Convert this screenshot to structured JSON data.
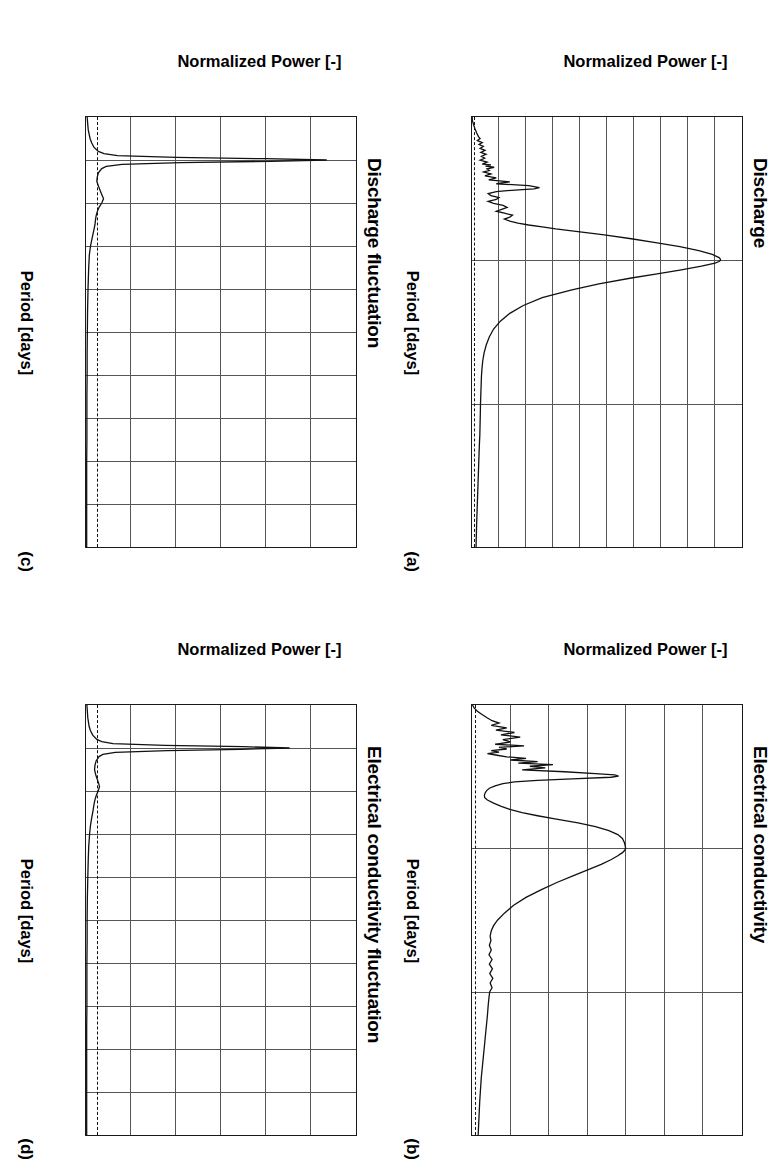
{
  "figure": {
    "axis_label_x": "Period [days]",
    "axis_label_y": "Normalized Power [-]"
  },
  "panels": [
    {
      "id": "a",
      "letter": "(a)",
      "title": "Discharge",
      "xlabel": "Period [days]",
      "ylabel": "Normalized Power [-]",
      "xticks": [
        "0",
        "365",
        "730",
        "1095"
      ],
      "yticks": [
        "0",
        "1000",
        "2000",
        "3000",
        "4000",
        "5000",
        "6000",
        "7000",
        "8000",
        "9000",
        "10000"
      ]
    },
    {
      "id": "b",
      "letter": "(b)",
      "title": "Electrical conductivity",
      "xlabel": "Period [days]",
      "ylabel": "Normalized Power [-]",
      "xticks": [
        "0",
        "365",
        "730",
        "1095"
      ],
      "yticks": [
        "0",
        "1000",
        "2000",
        "3000",
        "4000",
        "5000",
        "6000",
        "7000"
      ]
    },
    {
      "id": "c",
      "letter": "(c)",
      "title": "Discharge fluctuation",
      "xlabel": "Period [days]",
      "ylabel": "Normalized Power [-]",
      "xticks": [
        "0",
        "1",
        "2",
        "3",
        "4",
        "5",
        "6",
        "7",
        "8",
        "9",
        "10"
      ],
      "yticks": [
        "0",
        "200",
        "400",
        "600",
        "800",
        "1000",
        "1200"
      ]
    },
    {
      "id": "d",
      "letter": "(d)",
      "title": "Electrical conductivity fluctuation",
      "xlabel": "Period [days]",
      "ylabel": "Normalized Power [-]",
      "xticks": [
        "0",
        "1",
        "2",
        "3",
        "4",
        "5",
        "6",
        "7",
        "8",
        "9",
        "10"
      ],
      "yticks": [
        "0",
        "200",
        "400",
        "600",
        "800",
        "1000",
        "1200"
      ]
    }
  ],
  "chart_data": [
    {
      "type": "line",
      "panel": "a",
      "title": "Discharge",
      "xlabel": "Period [days]",
      "ylabel": "Normalized Power [-]",
      "xlim": [
        0,
        1095
      ],
      "ylim": [
        0,
        10000
      ],
      "xticks": [
        0,
        365,
        730,
        1095
      ],
      "yticks": [
        0,
        1000,
        2000,
        3000,
        4000,
        5000,
        6000,
        7000,
        8000,
        9000,
        10000
      ],
      "grid": true,
      "legend": "none",
      "annotations": [
        "(a)"
      ],
      "significance_threshold": 120,
      "x": [
        0,
        10,
        20,
        30,
        40,
        50,
        55,
        60,
        65,
        70,
        75,
        80,
        85,
        90,
        95,
        100,
        105,
        110,
        115,
        120,
        122,
        125,
        128,
        132,
        136,
        140,
        145,
        150,
        155,
        160,
        165,
        170,
        175,
        180,
        183,
        186,
        190,
        195,
        200,
        205,
        210,
        215,
        220,
        225,
        230,
        235,
        240,
        245,
        250,
        255,
        260,
        265,
        270,
        275,
        280,
        285,
        290,
        295,
        300,
        310,
        320,
        330,
        340,
        350,
        358,
        362,
        365,
        368,
        372,
        380,
        390,
        400,
        410,
        425,
        440,
        460,
        480,
        500,
        520,
        540,
        560,
        580,
        600,
        620,
        640,
        660,
        680,
        700,
        720,
        730,
        750,
        780,
        810,
        840,
        880,
        920,
        960,
        1000,
        1040,
        1095
      ],
      "y": [
        5,
        20,
        60,
        110,
        170,
        240,
        300,
        200,
        380,
        260,
        420,
        300,
        480,
        330,
        520,
        350,
        470,
        300,
        560,
        380,
        700,
        500,
        820,
        560,
        640,
        430,
        700,
        480,
        900,
        620,
        1400,
        900,
        2100,
        2500,
        2300,
        1600,
        900,
        600,
        700,
        1000,
        900,
        600,
        800,
        1150,
        1300,
        1100,
        900,
        1200,
        1500,
        1400,
        1200,
        1400,
        1700,
        2100,
        2600,
        3100,
        3700,
        4300,
        4900,
        5900,
        6800,
        7700,
        8400,
        8900,
        9150,
        9200,
        9200,
        9150,
        9000,
        8500,
        7700,
        6800,
        5900,
        4700,
        3700,
        2600,
        1900,
        1400,
        1050,
        800,
        640,
        530,
        450,
        400,
        370,
        350,
        340,
        330,
        320,
        315,
        310,
        300,
        290,
        270,
        250,
        230,
        210,
        190,
        170,
        150,
        120
      ]
    },
    {
      "type": "line",
      "panel": "b",
      "title": "Electrical conductivity",
      "xlabel": "Period [days]",
      "ylabel": "Normalized Power [-]",
      "xlim": [
        0,
        1095
      ],
      "ylim": [
        0,
        7000
      ],
      "xticks": [
        0,
        365,
        730,
        1095
      ],
      "yticks": [
        0,
        1000,
        2000,
        3000,
        4000,
        5000,
        6000,
        7000
      ],
      "grid": true,
      "legend": "none",
      "annotations": [
        "(b)"
      ],
      "significance_threshold": 110,
      "x": [
        0,
        8,
        16,
        24,
        32,
        40,
        46,
        52,
        58,
        64,
        70,
        76,
        82,
        88,
        94,
        100,
        104,
        108,
        112,
        116,
        120,
        124,
        128,
        132,
        136,
        140,
        144,
        148,
        152,
        156,
        160,
        165,
        170,
        175,
        178,
        181,
        184,
        188,
        192,
        196,
        200,
        206,
        212,
        218,
        224,
        230,
        236,
        242,
        250,
        258,
        266,
        274,
        282,
        290,
        300,
        310,
        320,
        330,
        340,
        350,
        358,
        363,
        366,
        370,
        376,
        384,
        394,
        406,
        420,
        436,
        452,
        470,
        490,
        510,
        530,
        548,
        562,
        575,
        588,
        600,
        612,
        624,
        636,
        648,
        660,
        672,
        684,
        696,
        708,
        720,
        730,
        745,
        765,
        790,
        820,
        860,
        900,
        950,
        1010,
        1095
      ],
      "y": [
        10,
        60,
        140,
        260,
        380,
        520,
        700,
        500,
        900,
        620,
        1100,
        750,
        1250,
        800,
        1000,
        600,
        1350,
        700,
        900,
        500,
        700,
        400,
        650,
        900,
        1400,
        1000,
        1700,
        1200,
        2100,
        1500,
        1900,
        1300,
        2400,
        3200,
        3700,
        3800,
        3600,
        2600,
        1700,
        1100,
        800,
        600,
        450,
        380,
        340,
        320,
        330,
        400,
        560,
        760,
        980,
        1300,
        1700,
        2150,
        2750,
        3200,
        3550,
        3780,
        3900,
        3950,
        3970,
        3980,
        3980,
        3960,
        3900,
        3780,
        3600,
        3350,
        3000,
        2600,
        2200,
        1800,
        1400,
        1080,
        840,
        660,
        560,
        500,
        470,
        490,
        450,
        500,
        440,
        520,
        450,
        530,
        460,
        540,
        470,
        520,
        460,
        440,
        420,
        400,
        370,
        330,
        290,
        240,
        200,
        160,
        110
      ]
    },
    {
      "type": "line",
      "panel": "c",
      "title": "Discharge fluctuation",
      "xlabel": "Period [days]",
      "ylabel": "Normalized Power [-]",
      "xlim": [
        0,
        10
      ],
      "ylim": [
        0,
        1200
      ],
      "xticks": [
        0,
        1,
        2,
        3,
        4,
        5,
        6,
        7,
        8,
        9,
        10
      ],
      "yticks": [
        0,
        200,
        400,
        600,
        800,
        1000,
        1200
      ],
      "grid": true,
      "legend": "none",
      "annotations": [
        "(c)"
      ],
      "significance_threshold": 55,
      "x": [
        0,
        0.3,
        0.5,
        0.6,
        0.7,
        0.8,
        0.85,
        0.9,
        0.94,
        0.97,
        1.0,
        1.03,
        1.06,
        1.1,
        1.15,
        1.2,
        1.3,
        1.4,
        1.5,
        1.6,
        1.7,
        1.8,
        1.9,
        2.0,
        2.1,
        2.2,
        2.3,
        2.4,
        2.5,
        2.6,
        2.7,
        2.8,
        2.9,
        3.0,
        3.2,
        3.5,
        4.0,
        4.5,
        5.0,
        5.5,
        6.0,
        6.5,
        7.0,
        7.5,
        8.0,
        8.5,
        9.0,
        9.5,
        10.0
      ],
      "y": [
        5,
        10,
        18,
        25,
        35,
        55,
        80,
        140,
        400,
        800,
        1070,
        820,
        420,
        160,
        90,
        70,
        55,
        50,
        48,
        55,
        62,
        70,
        78,
        70,
        58,
        50,
        45,
        42,
        40,
        36,
        32,
        28,
        24,
        20,
        15,
        12,
        9,
        7,
        6,
        5,
        5,
        4,
        4,
        4,
        3,
        3,
        3,
        3,
        3
      ]
    },
    {
      "type": "line",
      "panel": "d",
      "title": "Electrical conductivity fluctuation",
      "xlabel": "Period [days]",
      "ylabel": "Normalized Power [-]",
      "xlim": [
        0,
        10
      ],
      "ylim": [
        0,
        1200
      ],
      "xticks": [
        0,
        1,
        2,
        3,
        4,
        5,
        6,
        7,
        8,
        9,
        10
      ],
      "yticks": [
        0,
        200,
        400,
        600,
        800,
        1000,
        1200
      ],
      "grid": true,
      "legend": "none",
      "annotations": [
        "(d)"
      ],
      "significance_threshold": 55,
      "x": [
        0,
        0.3,
        0.5,
        0.6,
        0.7,
        0.8,
        0.85,
        0.9,
        0.94,
        0.97,
        1.0,
        1.03,
        1.06,
        1.1,
        1.15,
        1.2,
        1.3,
        1.4,
        1.5,
        1.6,
        1.7,
        1.8,
        1.9,
        2.0,
        2.1,
        2.2,
        2.3,
        2.4,
        2.5,
        2.6,
        2.8,
        3.0,
        3.3,
        3.6,
        4.0,
        4.5,
        5.0,
        5.5,
        6.0,
        6.5,
        7.0,
        7.5,
        8.0,
        8.5,
        9.0,
        9.5,
        10.0
      ],
      "y": [
        4,
        8,
        14,
        20,
        30,
        48,
        70,
        120,
        350,
        700,
        905,
        690,
        360,
        130,
        75,
        58,
        45,
        40,
        38,
        42,
        48,
        55,
        60,
        54,
        46,
        40,
        36,
        33,
        30,
        26,
        20,
        16,
        12,
        10,
        8,
        6,
        5,
        5,
        4,
        4,
        4,
        3,
        3,
        3,
        3,
        3,
        3
      ]
    }
  ]
}
